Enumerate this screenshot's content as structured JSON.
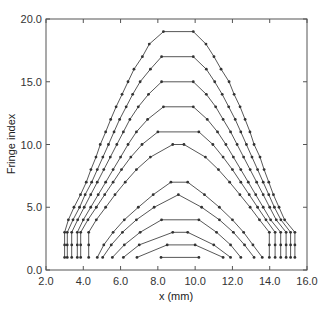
{
  "chart_data": {
    "type": "line",
    "title": "",
    "xlabel": "x (mm)",
    "ylabel": "Fringe index",
    "xlim": [
      2.0,
      16.0
    ],
    "ylim": [
      0.0,
      20.0
    ],
    "xticks": [
      "2.0",
      "4.0",
      "6.0",
      "8.0",
      "10.0",
      "12.0",
      "14.0",
      "16.0"
    ],
    "yticks": [
      "0.0",
      "5.0",
      "10.0",
      "15.0",
      "20.0"
    ],
    "grid": false,
    "legend": null,
    "line_color": "#444444",
    "series": [
      {
        "name": "fringe-19",
        "points": [
          [
            3.0,
            1
          ],
          [
            3.0,
            2
          ],
          [
            3.0,
            3
          ],
          [
            3.2,
            4
          ],
          [
            3.5,
            5
          ],
          [
            3.85,
            6
          ],
          [
            4.16,
            7
          ],
          [
            4.41,
            8
          ],
          [
            4.68,
            9
          ],
          [
            4.91,
            10
          ],
          [
            5.2,
            11
          ],
          [
            5.47,
            12
          ],
          [
            5.76,
            13
          ],
          [
            6.08,
            14
          ],
          [
            6.4,
            15
          ],
          [
            6.72,
            16
          ],
          [
            7.17,
            17
          ],
          [
            7.54,
            18
          ],
          [
            8.3,
            19
          ],
          [
            9.9,
            19
          ],
          [
            10.58,
            18
          ],
          [
            11.01,
            17
          ],
          [
            11.39,
            16
          ],
          [
            11.82,
            15
          ],
          [
            12.09,
            14
          ],
          [
            12.41,
            13
          ],
          [
            12.68,
            12
          ],
          [
            12.94,
            11
          ],
          [
            13.16,
            10
          ],
          [
            13.48,
            9
          ],
          [
            13.7,
            8
          ],
          [
            13.95,
            7
          ],
          [
            14.2,
            6
          ],
          [
            14.5,
            5
          ],
          [
            14.8,
            4
          ],
          [
            15.35,
            3
          ],
          [
            15.35,
            2
          ],
          [
            15.35,
            1
          ]
        ]
      },
      {
        "name": "fringe-17",
        "points": [
          [
            3.14,
            1
          ],
          [
            3.14,
            2
          ],
          [
            3.14,
            3
          ],
          [
            3.45,
            4
          ],
          [
            3.8,
            5
          ],
          [
            4.1,
            6
          ],
          [
            4.45,
            7
          ],
          [
            4.75,
            8
          ],
          [
            5.05,
            9
          ],
          [
            5.35,
            10
          ],
          [
            5.65,
            11
          ],
          [
            5.95,
            12
          ],
          [
            6.3,
            13
          ],
          [
            6.65,
            14
          ],
          [
            7.05,
            15
          ],
          [
            7.6,
            16
          ],
          [
            8.2,
            17
          ],
          [
            9.9,
            17
          ],
          [
            10.6,
            16
          ],
          [
            11.05,
            15
          ],
          [
            11.45,
            14
          ],
          [
            11.8,
            13
          ],
          [
            12.15,
            12
          ],
          [
            12.45,
            11
          ],
          [
            12.75,
            10
          ],
          [
            13.05,
            9
          ],
          [
            13.35,
            8
          ],
          [
            13.65,
            7
          ],
          [
            13.95,
            6
          ],
          [
            14.25,
            5
          ],
          [
            14.6,
            4
          ],
          [
            15.12,
            3
          ],
          [
            15.12,
            2
          ],
          [
            15.12,
            1
          ]
        ]
      },
      {
        "name": "fringe-15",
        "points": [
          [
            3.38,
            1
          ],
          [
            3.38,
            2
          ],
          [
            3.38,
            3
          ],
          [
            3.7,
            4
          ],
          [
            4.05,
            5
          ],
          [
            4.4,
            6
          ],
          [
            4.75,
            7
          ],
          [
            5.1,
            8
          ],
          [
            5.45,
            9
          ],
          [
            5.8,
            10
          ],
          [
            6.15,
            11
          ],
          [
            6.5,
            12
          ],
          [
            6.95,
            13
          ],
          [
            7.5,
            14
          ],
          [
            8.2,
            15
          ],
          [
            9.9,
            15
          ],
          [
            10.6,
            14
          ],
          [
            11.1,
            13
          ],
          [
            11.5,
            12
          ],
          [
            11.9,
            11
          ],
          [
            12.25,
            10
          ],
          [
            12.6,
            9
          ],
          [
            12.95,
            8
          ],
          [
            13.3,
            7
          ],
          [
            13.65,
            6
          ],
          [
            14.0,
            5
          ],
          [
            14.35,
            4
          ],
          [
            14.88,
            3
          ],
          [
            14.88,
            2
          ],
          [
            14.88,
            1
          ]
        ]
      },
      {
        "name": "fringe-13",
        "points": [
          [
            3.68,
            1
          ],
          [
            3.68,
            2
          ],
          [
            3.68,
            3
          ],
          [
            4.0,
            4
          ],
          [
            4.4,
            5
          ],
          [
            4.8,
            6
          ],
          [
            5.2,
            7
          ],
          [
            5.6,
            8
          ],
          [
            6.0,
            9
          ],
          [
            6.4,
            10
          ],
          [
            6.85,
            11
          ],
          [
            7.45,
            12
          ],
          [
            8.3,
            13
          ],
          [
            9.9,
            13
          ],
          [
            10.65,
            12
          ],
          [
            11.2,
            11
          ],
          [
            11.65,
            10
          ],
          [
            12.05,
            9
          ],
          [
            12.45,
            8
          ],
          [
            12.85,
            7
          ],
          [
            13.25,
            6
          ],
          [
            13.65,
            5
          ],
          [
            14.05,
            4
          ],
          [
            14.59,
            3
          ],
          [
            14.59,
            2
          ],
          [
            14.59,
            1
          ]
        ]
      },
      {
        "name": "fringe-11",
        "points": [
          [
            3.86,
            1
          ],
          [
            3.86,
            2
          ],
          [
            3.86,
            3
          ],
          [
            4.25,
            4
          ],
          [
            4.7,
            5
          ],
          [
            5.15,
            6
          ],
          [
            5.6,
            7
          ],
          [
            6.05,
            8
          ],
          [
            6.55,
            9
          ],
          [
            7.15,
            10
          ],
          [
            8.0,
            11
          ],
          [
            10.2,
            11
          ],
          [
            10.95,
            10
          ],
          [
            11.5,
            9
          ],
          [
            12.0,
            8
          ],
          [
            12.45,
            7
          ],
          [
            12.9,
            6
          ],
          [
            13.35,
            5
          ],
          [
            13.8,
            4
          ],
          [
            14.29,
            3
          ],
          [
            14.29,
            2
          ],
          [
            14.29,
            1
          ]
        ]
      },
      {
        "name": "fringe-10",
        "points": [
          [
            4.29,
            1
          ],
          [
            4.29,
            2
          ],
          [
            4.29,
            3
          ],
          [
            4.7,
            4
          ],
          [
            5.2,
            5
          ],
          [
            5.7,
            6
          ],
          [
            6.25,
            7
          ],
          [
            6.85,
            8
          ],
          [
            7.6,
            9
          ],
          [
            8.8,
            10
          ],
          [
            9.4,
            10
          ],
          [
            10.55,
            9
          ],
          [
            11.25,
            8
          ],
          [
            11.85,
            7
          ],
          [
            12.4,
            6
          ],
          [
            12.95,
            5
          ],
          [
            13.45,
            4
          ],
          [
            13.98,
            3
          ],
          [
            13.98,
            2
          ],
          [
            13.98,
            1
          ]
        ]
      },
      {
        "name": "fringe-7",
        "points": [
          [
            4.75,
            1
          ],
          [
            5.1,
            2
          ],
          [
            5.6,
            3
          ],
          [
            6.2,
            4
          ],
          [
            6.95,
            5
          ],
          [
            7.75,
            6
          ],
          [
            8.7,
            7
          ],
          [
            9.6,
            7
          ],
          [
            10.5,
            6
          ],
          [
            11.3,
            5
          ],
          [
            12.0,
            4
          ],
          [
            12.6,
            3
          ],
          [
            13.1,
            2
          ],
          [
            13.6,
            1
          ]
        ]
      },
      {
        "name": "fringe-6",
        "points": [
          [
            5.04,
            1
          ],
          [
            5.5,
            2
          ],
          [
            6.1,
            3
          ],
          [
            6.85,
            4
          ],
          [
            7.8,
            5
          ],
          [
            9.1,
            6
          ],
          [
            10.35,
            5
          ],
          [
            11.3,
            4
          ],
          [
            12.05,
            3
          ],
          [
            12.65,
            2
          ],
          [
            13.16,
            1
          ]
        ]
      },
      {
        "name": "fringe-4",
        "points": [
          [
            5.56,
            1
          ],
          [
            6.2,
            2
          ],
          [
            7.05,
            3
          ],
          [
            8.2,
            4
          ],
          [
            10.2,
            4
          ],
          [
            11.15,
            3
          ],
          [
            11.9,
            2
          ],
          [
            12.45,
            1
          ]
        ]
      },
      {
        "name": "fringe-3",
        "points": [
          [
            6.15,
            1
          ],
          [
            7.0,
            2
          ],
          [
            8.8,
            3
          ],
          [
            9.6,
            3
          ],
          [
            11.0,
            2
          ],
          [
            11.9,
            1
          ]
        ]
      },
      {
        "name": "fringe-2",
        "points": [
          [
            6.88,
            1
          ],
          [
            8.5,
            2
          ],
          [
            10.0,
            2
          ],
          [
            11.5,
            1
          ]
        ]
      },
      {
        "name": "fringe-1",
        "points": [
          [
            8.17,
            1
          ],
          [
            10.2,
            1
          ]
        ]
      }
    ]
  }
}
